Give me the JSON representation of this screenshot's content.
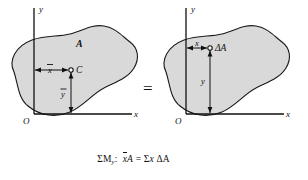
{
  "figure": {
    "left_diagram": {
      "name": "centroid-of-area",
      "axis_y_label": "y",
      "axis_x_label": "x",
      "origin_label": "O",
      "area_label": "A",
      "centroid_label": "C",
      "dim_x_label": "x",
      "dim_x_has_overbar": true,
      "dim_y_label": "y",
      "dim_y_has_overbar": true,
      "fill_color": "#d9d9d9",
      "stroke_color": "#1a1a1a"
    },
    "equals_sign": "=",
    "right_diagram": {
      "name": "element-of-area",
      "axis_y_label": "y",
      "axis_x_label": "x",
      "origin_label": "O",
      "element_label": "ΔA",
      "dim_x_label": "x",
      "dim_x_has_overbar": false,
      "dim_y_label": "y",
      "dim_y_has_overbar": false,
      "fill_color": "#d9d9d9",
      "stroke_color": "#1a1a1a"
    }
  },
  "equations": [
    {
      "moment_symbol": "ΣM",
      "moment_subscript": "y",
      "colon": ":",
      "lhs_var": "x",
      "lhs_overbar": true,
      "lhs_area": "A",
      "equals": "=",
      "rhs_sum": "Σ",
      "rhs_var": "x",
      "rhs_element": "ΔA",
      "plain": "ΣMy:  x̄A = Σx ΔA"
    },
    {
      "moment_symbol": "ΣM",
      "moment_subscript": "x",
      "colon": ":",
      "lhs_var": "y",
      "lhs_overbar": true,
      "lhs_area": "A",
      "equals": "=",
      "rhs_sum": "Σ",
      "rhs_var": "y",
      "rhs_element": "ΔA",
      "plain": "ΣMx:  ȳA = Σy ΔA"
    }
  ]
}
